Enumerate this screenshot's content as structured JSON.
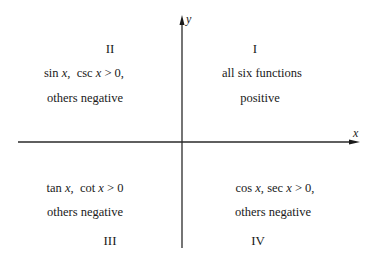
{
  "axes": {
    "x_label": "x",
    "y_label": "y",
    "color": "#2a2a2a"
  },
  "quadrants": {
    "q1": {
      "numeral": "I",
      "line1": "all six functions",
      "line2": "positive"
    },
    "q2": {
      "numeral": "II",
      "line1_fn1": "sin",
      "line1_var1": "x,",
      "line1_fn2": "csc",
      "line1_var2": "x",
      "line1_rel": "> 0,",
      "line2": "others negative"
    },
    "q3": {
      "numeral": "III",
      "line1_fn1": "tan",
      "line1_var1": "x,",
      "line1_fn2": "cot",
      "line1_var2": "x",
      "line1_rel": "> 0",
      "line2": "others negative"
    },
    "q4": {
      "numeral": "IV",
      "line1_fn1": "cos",
      "line1_var1": "x,",
      "line1_fn2": "sec",
      "line1_var2": "x",
      "line1_rel": "> 0,",
      "line2": "others negative"
    }
  }
}
